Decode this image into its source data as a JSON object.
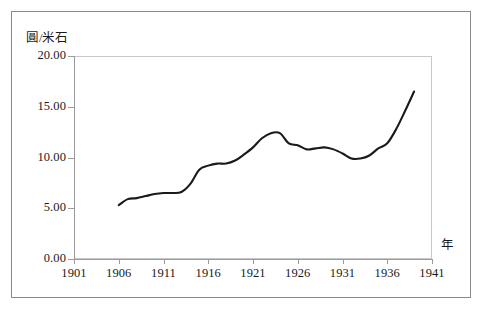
{
  "chart_data": {
    "type": "line",
    "title": "",
    "xlabel": "年",
    "ylabel": "圓/米石",
    "xlim": [
      1901,
      1941
    ],
    "ylim": [
      0,
      20
    ],
    "grid": false,
    "legend": null,
    "x_ticks": [
      "1901",
      "1906",
      "1911",
      "1916",
      "1921",
      "1926",
      "1931",
      "1936",
      "1941"
    ],
    "y_ticks": [
      "0.00",
      "5.00",
      "10.00",
      "15.00",
      "20.00"
    ],
    "series": [
      {
        "name": "米價",
        "color": "#1a1a1a",
        "x": [
          1906,
          1907,
          1908,
          1909,
          1910,
          1911,
          1912,
          1913,
          1914,
          1915,
          1916,
          1917,
          1918,
          1919,
          1920,
          1921,
          1922,
          1923,
          1924,
          1925,
          1926,
          1927,
          1928,
          1929,
          1930,
          1931,
          1932,
          1933,
          1934,
          1935,
          1936,
          1937,
          1938,
          1939
        ],
        "values": [
          5.3,
          5.9,
          6.0,
          6.2,
          6.4,
          6.5,
          6.5,
          6.6,
          7.4,
          8.8,
          9.2,
          9.4,
          9.4,
          9.7,
          10.3,
          11.0,
          11.9,
          12.4,
          12.4,
          11.4,
          11.2,
          10.8,
          10.9,
          11.0,
          10.8,
          10.4,
          9.9,
          9.9,
          10.2,
          10.9,
          11.4,
          12.8,
          14.6,
          16.5
        ]
      }
    ]
  },
  "axes": {
    "y_unit_label": "圓/米石",
    "x_unit_label": "年"
  },
  "caption": {
    "text": ""
  }
}
